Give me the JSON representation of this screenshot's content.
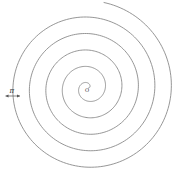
{
  "diagram": {
    "type": "archimedean-spiral",
    "center_label": "O",
    "spacing_label": "π",
    "stroke_color": "#8a8a8a",
    "center": [
      88,
      88
    ],
    "turns": 5,
    "spacing_px": 16.5
  }
}
